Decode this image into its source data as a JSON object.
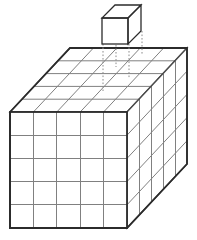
{
  "figure": {
    "title": "Five by five by five cube with one unit cube removed",
    "canvas": {
      "width": 197,
      "height": 240,
      "background": "#ffffff"
    }
  },
  "style": {
    "outline_color": "#2b2b2b",
    "grid_line_color": "#808080",
    "projection_line_color": "#8c8c8c",
    "face_fill_color": "#ffffff",
    "outline_width": 1.8,
    "grid_line_width": 1,
    "projection_dash": "1.6 1.9"
  },
  "geometry": {
    "divisions": 5,
    "front_face": {
      "label": "front-face",
      "origin_x": 10,
      "origin_y": 112,
      "width": 117,
      "height": 116,
      "rows": 5,
      "columns": 5
    },
    "depth_vector": {
      "dx": 60,
      "dy": -64
    },
    "top_face": {
      "label": "top-face",
      "rows": 5,
      "columns": 5,
      "corners": [
        {
          "name": "front-left",
          "x": 10,
          "y": 112
        },
        {
          "name": "front-right",
          "x": 127,
          "y": 112
        },
        {
          "name": "back-right",
          "x": 187,
          "y": 48
        },
        {
          "name": "back-left",
          "x": 70,
          "y": 48
        }
      ]
    },
    "right_face": {
      "label": "right-face",
      "rows": 5,
      "columns": 5,
      "corners": [
        {
          "name": "front-top",
          "x": 127,
          "y": 112
        },
        {
          "name": "back-top",
          "x": 187,
          "y": 48
        },
        {
          "name": "back-bottom",
          "x": 187,
          "y": 164
        },
        {
          "name": "front-bottom",
          "x": 127,
          "y": 228
        }
      ]
    },
    "small_cube": {
      "label": "detached-unit-cube",
      "front_face": {
        "x": 102,
        "y": 18,
        "width": 26,
        "height": 26
      },
      "depth_vector": {
        "dx": 13,
        "dy": -13
      }
    },
    "projection_lines": [
      {
        "name": "left-projection",
        "x": 103,
        "y_start": 45,
        "y_end": 90
      },
      {
        "name": "right-projection",
        "x": 129,
        "y_start": 45,
        "y_end": 78
      },
      {
        "name": "back-projection",
        "x": 116,
        "y_start": 32,
        "y_end": 66
      },
      {
        "name": "far-projection",
        "x": 142,
        "y_start": 32,
        "y_end": 56
      }
    ]
  },
  "counts": {
    "total_unit_cubes": 125,
    "removed_unit_cubes": 1,
    "remaining_unit_cubes": 124,
    "edge_length_units": 5
  }
}
